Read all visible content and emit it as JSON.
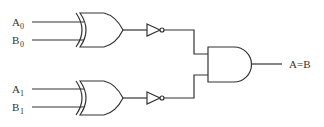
{
  "diagram": {
    "inputs": [
      {
        "name": "A",
        "sub": "0",
        "y": 22
      },
      {
        "name": "B",
        "sub": "0",
        "y": 40
      },
      {
        "name": "A",
        "sub": "1",
        "y": 89
      },
      {
        "name": "B",
        "sub": "1",
        "y": 107
      }
    ],
    "gates": [
      {
        "type": "XOR",
        "id": "xor0",
        "inputs": [
          "A0",
          "B0"
        ]
      },
      {
        "type": "NOT",
        "id": "not0",
        "inputs": [
          "xor0"
        ]
      },
      {
        "type": "XOR",
        "id": "xor1",
        "inputs": [
          "A1",
          "B1"
        ]
      },
      {
        "type": "NOT",
        "id": "not1",
        "inputs": [
          "xor1"
        ]
      },
      {
        "type": "AND",
        "id": "and0",
        "inputs": [
          "not0",
          "not1"
        ]
      }
    ],
    "output": {
      "label": "A=B"
    },
    "colors": {
      "line": "#333333",
      "background": "#ffffff"
    }
  }
}
